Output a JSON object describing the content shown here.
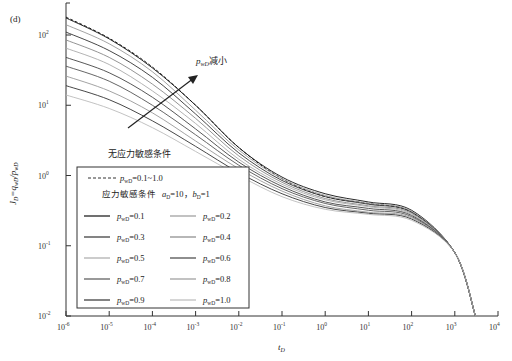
{
  "panel_label": "(d)",
  "chart_data": {
    "type": "line",
    "title": "",
    "xlabel": "t_D",
    "ylabel": "J_D = q_wD / p_wD",
    "xscale": "log",
    "yscale": "log",
    "xlim": [
      1e-06,
      10000.0
    ],
    "ylim": [
      0.01,
      300
    ],
    "grid": false,
    "x_ticks": [
      "10^-6",
      "10^-5",
      "10^-4",
      "10^-3",
      "10^-2",
      "10^-1",
      "10^0",
      "10^1",
      "10^2",
      "10^3",
      "10^4"
    ],
    "y_ticks": [
      "10^-2",
      "10^-1",
      "10^0",
      "10^1",
      "10^2"
    ],
    "legend_position": "lower-left inside",
    "annotations": [
      {
        "text": "p_wD减小",
        "meaning": "arrow indicating p_wD decreasing upward"
      },
      {
        "text": "无应力敏感条件"
      }
    ],
    "legend": {
      "no_stress": {
        "label": "p_wD=0.1~1.0",
        "style": "dashed"
      },
      "stress_header": "应力敏感条件  a_D=10, b_D=1",
      "entries": [
        "p_wD=0.1",
        "p_wD=0.2",
        "p_wD=0.3",
        "p_wD=0.4",
        "p_wD=0.5",
        "p_wD=0.6",
        "p_wD=0.7",
        "p_wD=0.8",
        "p_wD=0.9",
        "p_wD=1.0"
      ]
    },
    "x": [
      1e-06,
      1e-05,
      0.0001,
      0.001,
      0.01,
      0.1,
      1.0,
      10.0,
      100.0,
      1000.0,
      3000.0
    ],
    "series": [
      {
        "name": "no stress (p_wD=0.1~1.0)",
        "style": "dashed",
        "values": [
          180,
          90,
          35,
          10,
          2.5,
          0.9,
          0.5,
          0.4,
          0.3,
          0.08,
          0.01
        ]
      },
      {
        "name": "p_wD=0.1",
        "values": [
          175,
          88,
          34,
          10,
          2.5,
          0.95,
          0.55,
          0.42,
          0.32,
          0.08,
          0.01
        ]
      },
      {
        "name": "p_wD=0.2",
        "values": [
          140,
          75,
          30,
          8.5,
          2.3,
          0.9,
          0.52,
          0.4,
          0.31,
          0.08,
          0.01
        ]
      },
      {
        "name": "p_wD=0.3",
        "values": [
          110,
          60,
          25,
          7.5,
          2.1,
          0.85,
          0.5,
          0.39,
          0.3,
          0.08,
          0.01
        ]
      },
      {
        "name": "p_wD=0.4",
        "values": [
          85,
          48,
          20,
          6.5,
          1.9,
          0.8,
          0.47,
          0.37,
          0.29,
          0.08,
          0.01
        ]
      },
      {
        "name": "p_wD=0.5",
        "values": [
          65,
          38,
          16,
          5.5,
          1.7,
          0.75,
          0.45,
          0.36,
          0.28,
          0.08,
          0.01
        ]
      },
      {
        "name": "p_wD=0.6",
        "values": [
          48,
          29,
          13,
          4.6,
          1.55,
          0.7,
          0.42,
          0.34,
          0.27,
          0.08,
          0.01
        ]
      },
      {
        "name": "p_wD=0.7",
        "values": [
          36,
          22,
          10,
          3.8,
          1.4,
          0.65,
          0.4,
          0.32,
          0.26,
          0.08,
          0.01
        ]
      },
      {
        "name": "p_wD=0.8",
        "values": [
          26,
          16,
          7.8,
          3.1,
          1.25,
          0.6,
          0.37,
          0.3,
          0.25,
          0.08,
          0.01
        ]
      },
      {
        "name": "p_wD=0.9",
        "values": [
          19,
          12,
          6,
          2.6,
          1.1,
          0.55,
          0.35,
          0.29,
          0.24,
          0.08,
          0.01
        ]
      },
      {
        "name": "p_wD=1.0",
        "values": [
          14,
          9,
          4.8,
          2.2,
          1.0,
          0.5,
          0.33,
          0.28,
          0.23,
          0.08,
          0.01
        ]
      }
    ]
  },
  "labels": {
    "xaxis_main": "t",
    "xaxis_sub": "D",
    "yaxis": "J",
    "ticks_x": [
      {
        "base": "10",
        "exp": "-6"
      },
      {
        "base": "10",
        "exp": "-5"
      },
      {
        "base": "10",
        "exp": "-4"
      },
      {
        "base": "10",
        "exp": "-3"
      },
      {
        "base": "10",
        "exp": "-2"
      },
      {
        "base": "10",
        "exp": "-1"
      },
      {
        "base": "10",
        "exp": "0"
      },
      {
        "base": "10",
        "exp": "1"
      },
      {
        "base": "10",
        "exp": "2"
      },
      {
        "base": "10",
        "exp": "3"
      },
      {
        "base": "10",
        "exp": "4"
      }
    ],
    "ticks_y": [
      {
        "base": "10",
        "exp": "2"
      },
      {
        "base": "10",
        "exp": "1"
      },
      {
        "base": "10",
        "exp": "0"
      },
      {
        "base": "10",
        "exp": "-1"
      },
      {
        "base": "10",
        "exp": "-2"
      }
    ],
    "arrow_text_main": "p",
    "arrow_text_sub": "wD",
    "arrow_text_cn": "减小",
    "no_stress_title": "无应力敏感条件",
    "legend_dashed_val": "=0.1~1.0",
    "legend_stress_cn": "应力敏感条件",
    "legend_stress_params": "=10，",
    "legend_stress_b": "=1",
    "legend_vals": [
      "=0.1",
      "=0.2",
      "=0.3",
      "=0.4",
      "=0.5",
      "=0.6",
      "=0.7",
      "=0.8",
      "=0.9",
      "=1.0"
    ]
  }
}
